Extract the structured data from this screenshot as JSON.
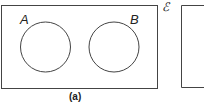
{
  "diagram": {
    "type": "venn",
    "panels": [
      {
        "caption": "(a)",
        "sets": [
          {
            "label": "A"
          },
          {
            "label": "B"
          }
        ],
        "relationship": "disjoint"
      }
    ],
    "universal_set_symbol": "ℰ"
  },
  "colors": {
    "stroke": "#333333",
    "background": "#ffffff"
  }
}
